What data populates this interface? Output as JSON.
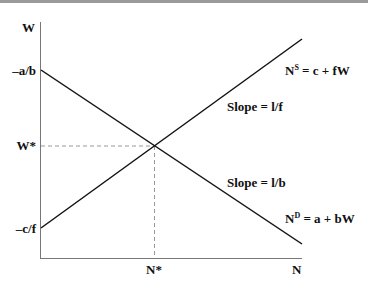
{
  "diagram": {
    "axes": {
      "y_label": "W",
      "x_label": "N"
    },
    "y_ticks": {
      "demand_intercept": "–a/b",
      "equilibrium_wage": "W*",
      "supply_intercept": "–c/f"
    },
    "x_ticks": {
      "equilibrium_employment": "N*"
    },
    "supply": {
      "eq_base": "N",
      "eq_sup": "S",
      "eq_rest": " = c + fW",
      "slope": "Slope = l/f"
    },
    "demand": {
      "eq_base": "N",
      "eq_sup": "D",
      "eq_rest": " = a + bW",
      "slope": "Slope = l/b"
    }
  }
}
